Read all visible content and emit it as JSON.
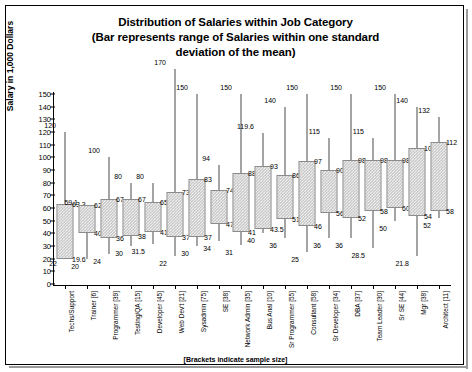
{
  "chart_data": {
    "type": "bar",
    "title": "Distribution of Salaries within  Job Category",
    "title_line2": "(Bar represents range of Salaries within one standard",
    "title_line3": "deviation of the mean)",
    "ylabel": "Salary  in 1,000 Dollars",
    "xlabel": "",
    "footnote": "[Brackets indicate sample size]",
    "ylim": [
      0,
      150
    ],
    "yticks": [
      0,
      10,
      20,
      30,
      40,
      50,
      60,
      70,
      80,
      90,
      100,
      110,
      120,
      130,
      140,
      150
    ],
    "grid": false,
    "legend": "none",
    "categories": [
      "Techs/Support",
      "Trainer [6]",
      "Programmer [39]",
      "Testing/QA [15]",
      "Developer [45]",
      "Web Dev't [21]",
      "Sysadmin [75]",
      "SE [38]",
      "Network Admin [35]",
      "Bus Anal [10]",
      "Sr Programmer [55]",
      "Consultant [58]",
      "Sr Developer [34]",
      "DBA [37]",
      "Team Leader [30]",
      "Sr SE [44]",
      "Mgr [38]",
      "Architect [11]"
    ],
    "series": [
      {
        "name": "max",
        "values": [
          120,
          59.1,
          100,
          80,
          80,
          170,
          150,
          94,
          150,
          119.6,
          140,
          150,
          115,
          150,
          115,
          150,
          140,
          132
        ]
      },
      {
        "name": "box_top",
        "values": [
          63.3,
          62,
          67,
          67,
          65,
          73,
          83,
          74,
          88,
          93,
          86,
          97,
          90,
          98,
          98,
          98,
          107,
          112
        ]
      },
      {
        "name": "box_bottom",
        "values": [
          19.6,
          40,
          36,
          38,
          41,
          37,
          37,
          47,
          41,
          43.5,
          51,
          46,
          56,
          52,
          58,
          60,
          54,
          58
        ]
      },
      {
        "name": "min",
        "values": [
          22,
          20,
          24,
          30,
          31.5,
          22,
          30,
          34,
          31,
          40,
          36,
          25,
          36,
          36,
          28.5,
          50,
          21.8,
          52
        ]
      }
    ],
    "point_labels": {
      "max": [
        "120",
        "59.1",
        "100",
        "80",
        "80",
        "170",
        "150",
        "94",
        "150",
        "119.6",
        "140",
        "150",
        "115",
        "150",
        "115",
        "150",
        "140",
        "132"
      ],
      "box_top": [
        "63.3",
        "62",
        "67",
        "67",
        "65",
        "73",
        "83",
        "74",
        "88",
        "93",
        "86",
        "97",
        "90",
        "98",
        "98",
        "98",
        "107",
        "112"
      ],
      "box_bottom": [
        "19.6",
        "40",
        "36",
        "38",
        "41",
        "37",
        "37",
        "47",
        "41",
        "43.5",
        "51",
        "46",
        "56",
        "52",
        "58",
        "60",
        "54",
        "58"
      ],
      "min": [
        "22",
        "20",
        "24",
        "30",
        "31.5",
        "22",
        "30",
        "34",
        "31",
        "40",
        "36",
        "25",
        "36",
        "36",
        "28.5",
        "50",
        "21.8",
        "52"
      ]
    },
    "colors": {
      "bar_fill": "#ededed",
      "bar_pattern": "#b9b9b9",
      "bar_border": "#8c8c8c",
      "whisker": "#4a4a4a",
      "axis": "#000000",
      "text": "#000000",
      "background": "#ffffff"
    }
  }
}
